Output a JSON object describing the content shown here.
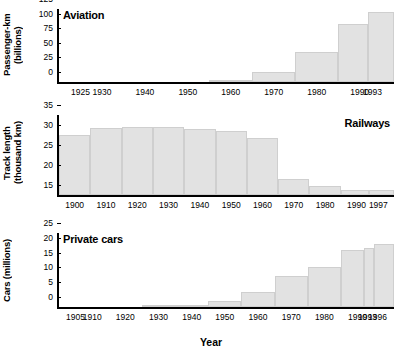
{
  "figure": {
    "xaxis_title": "Year",
    "bar_fill": "#e2e2e2",
    "bar_stroke": "#cfcfcf",
    "axis_color": "#000000"
  },
  "chart_data": [
    {
      "type": "bar",
      "title": "Aviation",
      "ylabel": "Passenger-km\n(billions)",
      "xlabel": "",
      "ylim": [
        0,
        125
      ],
      "yticks": [
        0,
        25,
        50,
        75,
        100,
        125
      ],
      "xlim": [
        1920,
        1998
      ],
      "xticks": [
        1925,
        1930,
        1940,
        1950,
        1960,
        1970,
        1980,
        1990,
        1993
      ],
      "grid": false,
      "legend": "none",
      "bins": [
        {
          "start": 1920,
          "end": 1935,
          "value": 0
        },
        {
          "start": 1935,
          "end": 1945,
          "value": 0
        },
        {
          "start": 1945,
          "end": 1955,
          "value": 0.4
        },
        {
          "start": 1955,
          "end": 1965,
          "value": 2.2
        },
        {
          "start": 1965,
          "end": 1975,
          "value": 17
        },
        {
          "start": 1975,
          "end": 1985,
          "value": 51
        },
        {
          "start": 1985,
          "end": 1992,
          "value": 100
        },
        {
          "start": 1992,
          "end": 1998,
          "value": 120
        }
      ]
    },
    {
      "type": "bar",
      "title": "Railways",
      "ylabel": "Track length\n(thousand km)",
      "xlabel": "",
      "ylim": [
        15,
        35
      ],
      "yticks": [
        15,
        20,
        25,
        30,
        35
      ],
      "xlim": [
        1895,
        2002
      ],
      "xticks": [
        1900,
        1910,
        1920,
        1930,
        1940,
        1950,
        1960,
        1970,
        1980,
        1990,
        1997
      ],
      "grid": false,
      "legend": "none",
      "bins": [
        {
          "start": 1895,
          "end": 1905,
          "value": 30.0
        },
        {
          "start": 1905,
          "end": 1915,
          "value": 31.8
        },
        {
          "start": 1915,
          "end": 1925,
          "value": 32.0
        },
        {
          "start": 1925,
          "end": 1935,
          "value": 32.0
        },
        {
          "start": 1935,
          "end": 1945,
          "value": 31.6
        },
        {
          "start": 1945,
          "end": 1955,
          "value": 31.0
        },
        {
          "start": 1955,
          "end": 1965,
          "value": 29.3
        },
        {
          "start": 1965,
          "end": 1975,
          "value": 19.0
        },
        {
          "start": 1975,
          "end": 1985,
          "value": 17.3
        },
        {
          "start": 1985,
          "end": 1994,
          "value": 16.3
        },
        {
          "start": 1994,
          "end": 2002,
          "value": 16.3
        }
      ]
    },
    {
      "type": "bar",
      "title": "Private cars",
      "ylabel": "Cars (millions)",
      "xlabel": "Year",
      "ylim": [
        0,
        25
      ],
      "yticks": [
        0,
        5,
        10,
        15,
        20,
        25
      ],
      "xlim": [
        1900,
        2001
      ],
      "xticks": [
        1905,
        1910,
        1920,
        1930,
        1940,
        1950,
        1960,
        1970,
        1980,
        1990,
        1993,
        1996
      ],
      "grid": false,
      "legend": "none",
      "bins": [
        {
          "start": 1900,
          "end": 1925,
          "value": 0
        },
        {
          "start": 1925,
          "end": 1935,
          "value": 0.4
        },
        {
          "start": 1935,
          "end": 1945,
          "value": 0.7
        },
        {
          "start": 1945,
          "end": 1955,
          "value": 2.2
        },
        {
          "start": 1955,
          "end": 1965,
          "value": 5.1
        },
        {
          "start": 1965,
          "end": 1975,
          "value": 10.4
        },
        {
          "start": 1975,
          "end": 1985,
          "value": 13.6
        },
        {
          "start": 1985,
          "end": 1992,
          "value": 19.1
        },
        {
          "start": 1992,
          "end": 1995,
          "value": 20.0
        },
        {
          "start": 1995,
          "end": 2001,
          "value": 21.2
        }
      ]
    }
  ]
}
